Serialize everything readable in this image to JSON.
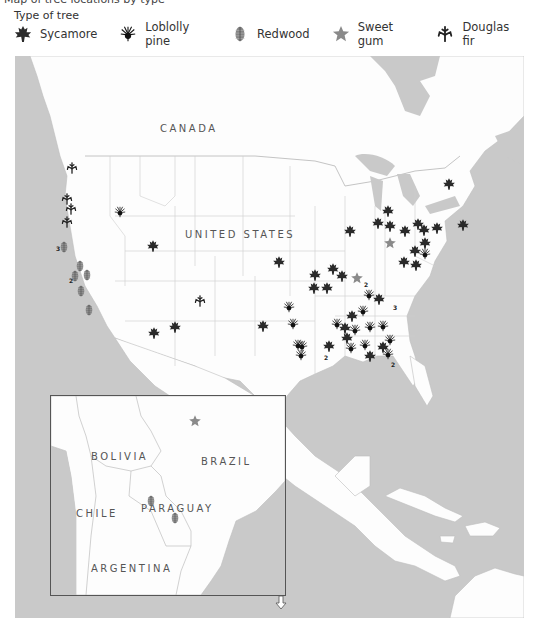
{
  "header": {
    "cutoff_text": "Map of tree locations by type"
  },
  "legend": {
    "title": "Type of tree",
    "items": [
      {
        "key": "sycamore",
        "label": "Sycamore",
        "color": "#2a2a2a"
      },
      {
        "key": "loblolly",
        "label": "Loblolly pine",
        "color": "#111111"
      },
      {
        "key": "redwood",
        "label": "Redwood",
        "color": "#6e6e6e"
      },
      {
        "key": "sweetgum",
        "label": "Sweet gum",
        "color": "#8a8a8a"
      },
      {
        "key": "douglas",
        "label": "Douglas fir",
        "color": "#222222"
      }
    ]
  },
  "colors": {
    "water": "#c9c9c9",
    "land": "#fdfdfd",
    "border": "#bdbdbd",
    "label": "#555555"
  },
  "map": {
    "labels": [
      {
        "text": "CANADA",
        "x": 160,
        "y": 67
      },
      {
        "text": "UNITED STATES",
        "x": 185,
        "y": 173
      }
    ],
    "markers": [
      {
        "type": "douglas",
        "x": 72,
        "y": 112
      },
      {
        "type": "douglas",
        "x": 67,
        "y": 143
      },
      {
        "type": "douglas",
        "x": 71,
        "y": 153
      },
      {
        "type": "douglas",
        "x": 67,
        "y": 166
      },
      {
        "type": "loblolly",
        "x": 120,
        "y": 156
      },
      {
        "type": "redwood",
        "x": 64,
        "y": 191
      },
      {
        "type": "redwood",
        "x": 80,
        "y": 210
      },
      {
        "type": "redwood",
        "x": 75,
        "y": 220
      },
      {
        "type": "redwood",
        "x": 87,
        "y": 219
      },
      {
        "type": "redwood",
        "x": 81,
        "y": 235
      },
      {
        "type": "redwood",
        "x": 89,
        "y": 254
      },
      {
        "type": "sycamore",
        "x": 153,
        "y": 190
      },
      {
        "type": "sycamore",
        "x": 154,
        "y": 277
      },
      {
        "type": "sycamore",
        "x": 175,
        "y": 271
      },
      {
        "type": "douglas",
        "x": 200,
        "y": 245
      },
      {
        "type": "sycamore",
        "x": 263,
        "y": 270
      },
      {
        "type": "sycamore",
        "x": 279,
        "y": 206
      },
      {
        "type": "sycamore",
        "x": 315,
        "y": 219
      },
      {
        "type": "sycamore",
        "x": 350,
        "y": 175
      },
      {
        "type": "sycamore",
        "x": 342,
        "y": 220
      },
      {
        "type": "sycamore",
        "x": 333,
        "y": 213
      },
      {
        "type": "sycamore",
        "x": 327,
        "y": 232
      },
      {
        "type": "sycamore",
        "x": 314,
        "y": 232
      },
      {
        "type": "sweetgum",
        "x": 357,
        "y": 222
      },
      {
        "type": "loblolly",
        "x": 289,
        "y": 251
      },
      {
        "type": "loblolly",
        "x": 293,
        "y": 268
      },
      {
        "type": "loblolly",
        "x": 298,
        "y": 289
      },
      {
        "type": "loblolly",
        "x": 301,
        "y": 299
      },
      {
        "type": "loblolly",
        "x": 369,
        "y": 239
      },
      {
        "type": "sycamore",
        "x": 379,
        "y": 243
      },
      {
        "type": "loblolly",
        "x": 363,
        "y": 255
      },
      {
        "type": "sycamore",
        "x": 352,
        "y": 260
      },
      {
        "type": "sycamore",
        "x": 345,
        "y": 272
      },
      {
        "type": "sycamore",
        "x": 347,
        "y": 282
      },
      {
        "type": "loblolly",
        "x": 355,
        "y": 274
      },
      {
        "type": "loblolly",
        "x": 370,
        "y": 271
      },
      {
        "type": "loblolly",
        "x": 337,
        "y": 268
      },
      {
        "type": "loblolly",
        "x": 351,
        "y": 292
      },
      {
        "type": "loblolly",
        "x": 365,
        "y": 289
      },
      {
        "type": "sycamore",
        "x": 329,
        "y": 290
      },
      {
        "type": "loblolly",
        "x": 302,
        "y": 290
      },
      {
        "type": "loblolly",
        "x": 383,
        "y": 270
      },
      {
        "type": "loblolly",
        "x": 390,
        "y": 284
      },
      {
        "type": "sycamore",
        "x": 383,
        "y": 291
      },
      {
        "type": "sycamore",
        "x": 370,
        "y": 300
      },
      {
        "type": "loblolly",
        "x": 388,
        "y": 298
      },
      {
        "type": "sycamore",
        "x": 388,
        "y": 155
      },
      {
        "type": "sycamore",
        "x": 378,
        "y": 167
      },
      {
        "type": "sycamore",
        "x": 390,
        "y": 170
      },
      {
        "type": "sycamore",
        "x": 405,
        "y": 175
      },
      {
        "type": "sycamore",
        "x": 418,
        "y": 168
      },
      {
        "type": "sycamore",
        "x": 424,
        "y": 174
      },
      {
        "type": "sycamore",
        "x": 437,
        "y": 172
      },
      {
        "type": "sycamore",
        "x": 425,
        "y": 187
      },
      {
        "type": "loblolly",
        "x": 425,
        "y": 198
      },
      {
        "type": "sycamore",
        "x": 415,
        "y": 195
      },
      {
        "type": "sycamore",
        "x": 404,
        "y": 206
      },
      {
        "type": "sycamore",
        "x": 416,
        "y": 209
      },
      {
        "type": "sweetgum",
        "x": 390,
        "y": 187
      },
      {
        "type": "sycamore",
        "x": 463,
        "y": 169
      },
      {
        "type": "sycamore",
        "x": 449,
        "y": 128
      }
    ],
    "numbers": [
      {
        "text": "3",
        "x": 56,
        "y": 189
      },
      {
        "text": "2",
        "x": 69,
        "y": 221
      },
      {
        "text": "2",
        "x": 364,
        "y": 225
      },
      {
        "text": "3",
        "x": 393,
        "y": 248
      },
      {
        "text": "2",
        "x": 324,
        "y": 298
      },
      {
        "text": "2",
        "x": 391,
        "y": 305
      }
    ]
  },
  "inset": {
    "labels": [
      {
        "text": "BOLIVIA",
        "x": 40,
        "y": 55
      },
      {
        "text": "BRAZIL",
        "x": 150,
        "y": 60
      },
      {
        "text": "CHILE",
        "x": 25,
        "y": 112
      },
      {
        "text": "PARAGUAY",
        "x": 90,
        "y": 107
      },
      {
        "text": "ARGENTINA",
        "x": 40,
        "y": 167
      }
    ],
    "markers": [
      {
        "type": "sweetgum",
        "x": 144,
        "y": 25
      },
      {
        "type": "redwood",
        "x": 100,
        "y": 105
      },
      {
        "type": "redwood",
        "x": 124,
        "y": 122
      }
    ]
  }
}
